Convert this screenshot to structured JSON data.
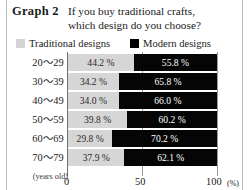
{
  "figure": {
    "label": "Graph 2",
    "title_line1": "If you buy traditional crafts,",
    "title_line2": "which design do you choose?"
  },
  "legend": {
    "traditional": "Traditional designs",
    "modern": "Modern designs",
    "traditional_color": "#d6d6d6",
    "modern_color": "#000000"
  },
  "axis": {
    "unit": "(%)",
    "age_unit": "(years old)",
    "ticks": [
      "0",
      "50",
      "100"
    ]
  },
  "rows": [
    {
      "age": "20～29",
      "trad": "44.2 %",
      "modern": "55.8 %"
    },
    {
      "age": "30～39",
      "trad": "34.2 %",
      "modern": "65.8 %"
    },
    {
      "age": "40～49",
      "trad": "34.0 %",
      "modern": "66.0 %"
    },
    {
      "age": "50～59",
      "trad": "39.8 %",
      "modern": "60.2 %"
    },
    {
      "age": "60～69",
      "trad": "29.8 %",
      "modern": "70.2 %"
    },
    {
      "age": "70～79",
      "trad": "37.9 %",
      "modern": "62.1 %"
    }
  ],
  "chart_data": {
    "type": "bar",
    "orientation": "horizontal",
    "stacked": true,
    "title": "Graph 2  If you buy traditional crafts, which design do you choose?",
    "xlabel": "(%)",
    "ylabel": "(years old)",
    "xlim": [
      0,
      100
    ],
    "xticks": [
      0,
      50,
      100
    ],
    "grid": true,
    "legend_position": "top",
    "categories": [
      "20～29",
      "30～39",
      "40～49",
      "50～59",
      "60～69",
      "70～79"
    ],
    "series": [
      {
        "name": "Traditional designs",
        "color": "#d6d6d6",
        "values": [
          44.2,
          34.2,
          34.0,
          39.8,
          29.8,
          37.9
        ]
      },
      {
        "name": "Modern designs",
        "color": "#000000",
        "values": [
          55.8,
          65.8,
          66.0,
          60.2,
          70.2,
          62.1
        ]
      }
    ],
    "data_labels": [
      [
        "44.2 %",
        "55.8 %"
      ],
      [
        "34.2 %",
        "65.8 %"
      ],
      [
        "34.0 %",
        "66.0 %"
      ],
      [
        "39.8 %",
        "60.2 %"
      ],
      [
        "29.8 %",
        "70.2 %"
      ],
      [
        "37.9 %",
        "62.1 %"
      ]
    ]
  }
}
